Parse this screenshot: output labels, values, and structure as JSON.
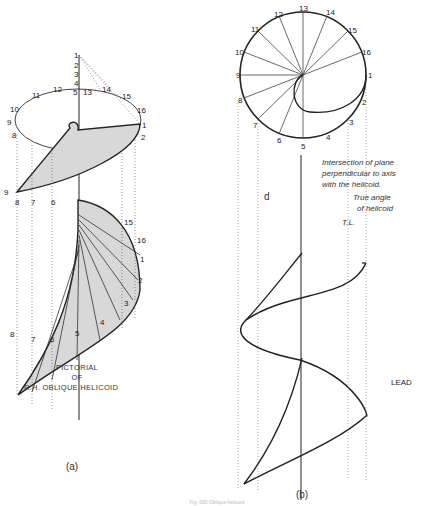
{
  "figure": {
    "caption": "Fig. 000 Oblique helicoid",
    "subfigures": [
      {
        "id": "a",
        "label": "(a)",
        "title_lines": [
          "PICTORIAL",
          "OF",
          "R.H. OBLIQUE HELICOID"
        ],
        "circle_points": [
          "1",
          "2",
          "3",
          "4",
          "5",
          "6",
          "7",
          "8",
          "9",
          "10",
          "11",
          "12",
          "13",
          "14",
          "15",
          "16"
        ],
        "axis_points": [
          "1",
          "2",
          "3",
          "4",
          "5",
          "6",
          "7",
          "8",
          "9",
          "10",
          "11",
          "12",
          "13",
          "14",
          "15",
          "16"
        ]
      },
      {
        "id": "b",
        "label": "(b)",
        "circle_points": [
          "1",
          "2",
          "3",
          "4",
          "5",
          "6",
          "7",
          "8",
          "9",
          "10",
          "11",
          "12",
          "13",
          "14",
          "15",
          "16"
        ],
        "annotations": {
          "intersection_note": [
            "Intersection of plane",
            "perpendicular to axis",
            "with the helicoid."
          ],
          "true_angle_note": [
            "True angle",
            "of helicoid"
          ],
          "true_length": "T.L.",
          "lead": "LEAD",
          "lead_fraction_top": "LEAD",
          "lead_fraction_bottom": "16",
          "d": "d"
        }
      }
    ]
  }
}
